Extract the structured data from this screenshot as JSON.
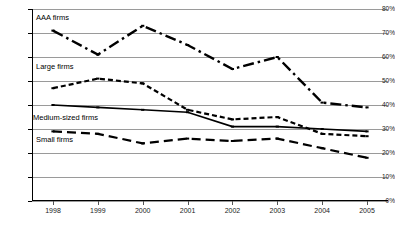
{
  "chart_data": {
    "type": "line",
    "title": "",
    "xlabel": "",
    "ylabel": "",
    "categories": [
      "1998",
      "1999",
      "2000",
      "2001",
      "2002",
      "2003",
      "2004",
      "2005"
    ],
    "ylim": [
      0,
      80
    ],
    "yticks": [
      "0%",
      "10%",
      "20%",
      "30%",
      "40%",
      "50%",
      "60%",
      "70%",
      "80%"
    ],
    "ytick_values": [
      0,
      10,
      20,
      30,
      40,
      50,
      60,
      70,
      80
    ],
    "grid": true,
    "legend": "inline-labels",
    "series": [
      {
        "name": "AAA firms",
        "style": "dash-dot",
        "color": "#000000",
        "values": [
          71,
          61,
          73,
          65,
          55,
          60,
          41,
          39
        ]
      },
      {
        "name": "Large firms",
        "style": "short-dash",
        "color": "#000000",
        "values": [
          47,
          51,
          49,
          38,
          34,
          35,
          28,
          27
        ]
      },
      {
        "name": "Medium-sized firms",
        "style": "solid",
        "color": "#000000",
        "values": [
          40,
          39,
          38,
          37,
          31,
          31,
          30,
          29
        ]
      },
      {
        "name": "Small firms",
        "style": "long-dash",
        "color": "#000000",
        "values": [
          29,
          28,
          24,
          26,
          25,
          26,
          22,
          18
        ]
      }
    ],
    "series_label_positions": [
      {
        "name": "AAA firms",
        "x": 36,
        "y": 13
      },
      {
        "name": "Large firms",
        "x": 36,
        "y": 62
      },
      {
        "name": "Medium-sized firms",
        "x": 33,
        "y": 113
      },
      {
        "name": "Small firms",
        "x": 36,
        "y": 135
      }
    ]
  }
}
